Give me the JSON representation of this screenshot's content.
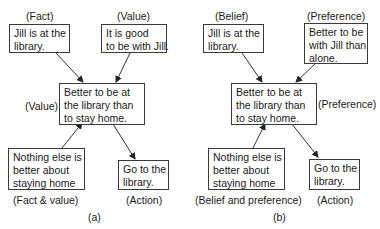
{
  "panel_a": {
    "caption": "(a)",
    "top_left": {
      "tag": "(Fact)",
      "text_lines": [
        "Jill is at the",
        "library."
      ]
    },
    "top_right": {
      "tag": "(Value)",
      "text_lines": [
        "It is good",
        "to be with Jill."
      ]
    },
    "center": {
      "tag": "(Value)",
      "text_lines": [
        "Better to be at",
        "the library than",
        "to stay home."
      ]
    },
    "bottom_left": {
      "tag": "(Fact & value)",
      "text_lines": [
        "Nothing else is",
        "better about",
        "staying home"
      ]
    },
    "bottom_right": {
      "tag": "(Action)",
      "text_lines": [
        "Go to the",
        "library."
      ]
    }
  },
  "panel_b": {
    "caption": "(b)",
    "top_left": {
      "tag": "(Belief)",
      "text_lines": [
        "Jill is at the",
        "library."
      ]
    },
    "top_right": {
      "tag": "(Preference)",
      "text_lines": [
        "Better to be",
        "with Jill than",
        "alone."
      ]
    },
    "center": {
      "tag": "(Preference)",
      "text_lines": [
        "Better to be at",
        "the library than",
        "to stay home."
      ]
    },
    "bottom_left": {
      "tag": "(Belief and preference)",
      "text_lines": [
        "Nothing else is",
        "better about",
        "staying home"
      ]
    },
    "bottom_right": {
      "tag": "(Action)",
      "text_lines": [
        "Go to the",
        "library."
      ]
    }
  }
}
